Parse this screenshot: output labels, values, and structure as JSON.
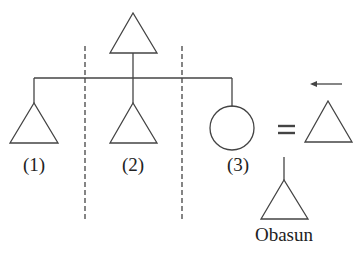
{
  "diagram": {
    "type": "kinship-chart",
    "colors": {
      "stroke": "#444444",
      "text": "#222222"
    },
    "nodes": [
      {
        "id": "parent",
        "shape": "triangle",
        "meaning": "male"
      },
      {
        "id": "child1",
        "shape": "triangle",
        "label": "(1)"
      },
      {
        "id": "child2",
        "shape": "triangle",
        "label": "(2)"
      },
      {
        "id": "child3",
        "shape": "circle",
        "label": "(3)"
      },
      {
        "id": "spouse",
        "shape": "triangle",
        "relation": "=",
        "note": "arrow pointing left above"
      },
      {
        "id": "obasun",
        "shape": "triangle",
        "label": "Obasun"
      }
    ],
    "labels": {
      "child1": "(1)",
      "child2": "(2)",
      "child3": "(3)",
      "marriage_symbol": "=",
      "obasun": "Obasun"
    }
  }
}
